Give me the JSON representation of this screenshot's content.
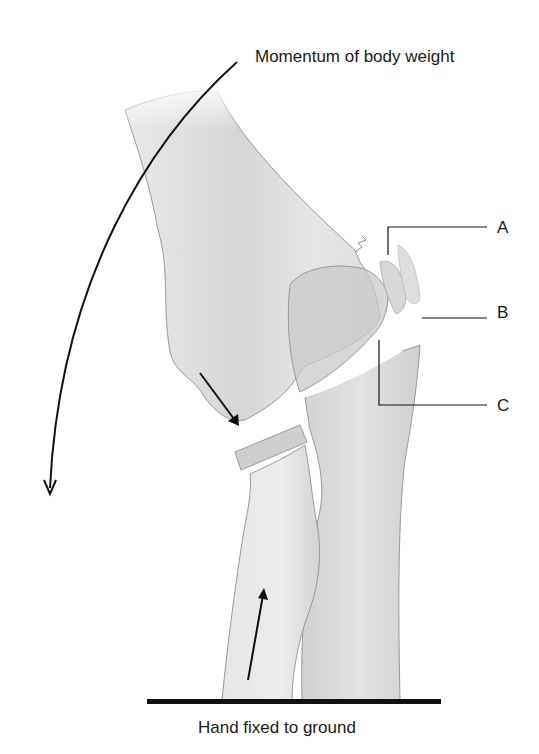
{
  "diagram": {
    "top_label": "Momentum of body weight",
    "bottom_label": "Hand fixed to ground",
    "callouts": [
      {
        "letter": "A"
      },
      {
        "letter": "B"
      },
      {
        "letter": "C"
      }
    ],
    "colors": {
      "background": "#ffffff",
      "bone_light": "#e4e4e4",
      "bone_mid": "#cfcfcf",
      "bone_dark": "#b8b8b8",
      "outline": "#8a8a8a",
      "ink": "#111111"
    },
    "arrows": [
      {
        "name": "momentum-arc-arrow",
        "direction": "down-left"
      },
      {
        "name": "humerus-force-arrow",
        "direction": "down-right"
      },
      {
        "name": "radius-force-arrow",
        "direction": "up"
      }
    ]
  }
}
